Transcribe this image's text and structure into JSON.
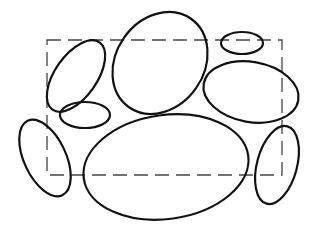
{
  "diagram": {
    "type": "ellipses-in-bounding-box",
    "background": "#ffffff",
    "stroke_color": "#111111",
    "bounding_box": {
      "x1": 47,
      "y1": 40,
      "x2": 282,
      "y2": 175,
      "style": "dashed",
      "color": "#444444"
    },
    "ellipses": [
      {
        "id": "upper-left",
        "cx": 76,
        "cy": 76,
        "rx": 21,
        "ry": 41,
        "rotate": 35
      },
      {
        "id": "upper-center-large",
        "cx": 160,
        "cy": 63,
        "rx": 44,
        "ry": 54,
        "rotate": 35
      },
      {
        "id": "small-top-right",
        "cx": 242,
        "cy": 43,
        "rx": 21,
        "ry": 11,
        "rotate": 0
      },
      {
        "id": "mid-right",
        "cx": 251,
        "cy": 92,
        "rx": 48,
        "ry": 30,
        "rotate": 10
      },
      {
        "id": "small-mid-left",
        "cx": 85,
        "cy": 115,
        "rx": 25,
        "ry": 13,
        "rotate": 0
      },
      {
        "id": "lower-left",
        "cx": 45,
        "cy": 158,
        "rx": 21,
        "ry": 41,
        "rotate": -25
      },
      {
        "id": "bottom-center-large",
        "cx": 166,
        "cy": 167,
        "rx": 83,
        "ry": 52,
        "rotate": -8
      },
      {
        "id": "lower-right",
        "cx": 277,
        "cy": 165,
        "rx": 20,
        "ry": 40,
        "rotate": 15
      }
    ]
  }
}
